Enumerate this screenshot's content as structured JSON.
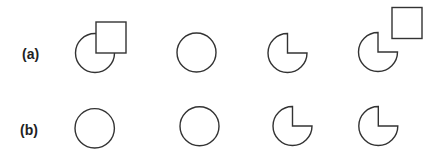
{
  "figure": {
    "rows": [
      {
        "label": "(a)",
        "shapes": [
          {
            "type": "circle-with-square",
            "description": "circle partially occluded by square at upper right"
          },
          {
            "type": "circle",
            "description": "full circle"
          },
          {
            "type": "pie-notch",
            "description": "circle with upper-right quarter removed"
          },
          {
            "type": "pie-notch-with-square",
            "description": "circle with upper-right quarter removed, separate square at upper right"
          }
        ]
      },
      {
        "label": "(b)",
        "shapes": [
          {
            "type": "circle",
            "description": "full circle"
          },
          {
            "type": "circle",
            "description": "full circle"
          },
          {
            "type": "pie-notch",
            "description": "circle with upper-right quarter removed"
          },
          {
            "type": "pie-notch",
            "description": "circle with upper-right quarter removed"
          }
        ]
      }
    ],
    "colors": {
      "stroke": "#333333",
      "fill": "#ffffff",
      "label": "#222222"
    }
  }
}
